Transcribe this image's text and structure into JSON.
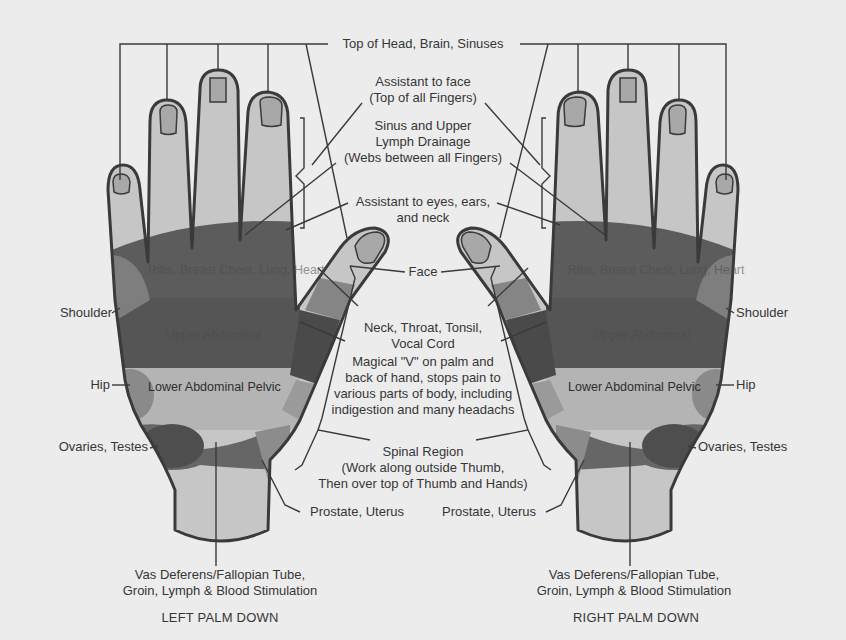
{
  "diagram": {
    "title_labels": {
      "top_of_head": "Top of Head, Brain, Sinuses",
      "assistant_face": [
        "Assistant to face",
        "(Top of all Fingers)"
      ],
      "sinus": [
        "Sinus and Upper",
        "Lymph Drainage",
        "(Webs between all Fingers)"
      ],
      "assistant_eyes": [
        "Assistant to eyes, ears,",
        "and neck"
      ],
      "face": "Face",
      "neck": [
        "Neck, Throat, Tonsil,",
        "Vocal Cord"
      ],
      "magical_v": [
        "Magical \"V\" on palm and",
        "back of hand, stops pain to",
        "various parts of body, including",
        "indigestion and many headachs"
      ],
      "spinal": [
        "Spinal Region",
        "(Work along outside Thumb,",
        "Then over top of Thumb and Hands)"
      ]
    },
    "left_hand": {
      "caption": "LEFT PALM DOWN",
      "side_labels": {
        "shoulder": "Shoulder",
        "hip": "Hip",
        "ovaries": "Ovaries, Testes"
      },
      "bottom_labels": {
        "prostate": "Prostate, Uterus",
        "vas": [
          "Vas Deferens/Fallopian Tube,",
          "Groin, Lymph & Blood Stimulation"
        ]
      },
      "zones": {
        "ribs": [
          "Ribs, Breast",
          "Chest, Lung, Heart"
        ],
        "upper_abdominal": "Upper Abdominal",
        "lower_abdominal": [
          "Lower Abdominal",
          "Pelvic"
        ]
      }
    },
    "right_hand": {
      "caption": "RIGHT PALM DOWN",
      "side_labels": {
        "shoulder": "Shoulder",
        "hip": "Hip",
        "ovaries": "Ovaries, Testes"
      },
      "bottom_labels": {
        "prostate": "Prostate, Uterus",
        "vas": [
          "Vas Deferens/Fallopian Tube,",
          "Groin, Lymph & Blood Stimulation"
        ]
      },
      "zones": {
        "ribs": [
          "Ribs, Breast",
          "Chest, Lung, Heart"
        ],
        "upper_abdominal": "Upper Abdominal",
        "lower_abdominal": [
          "Lower Abdominal",
          "Pelvic"
        ]
      }
    },
    "colors": {
      "background": "#ececec",
      "skin_light": "#c6c6c6",
      "zone_dark": "#5e5e5e",
      "zone_mid": "#8a8a8a",
      "nail": "#a8a8a8",
      "outline": "#3a3a3a"
    }
  }
}
